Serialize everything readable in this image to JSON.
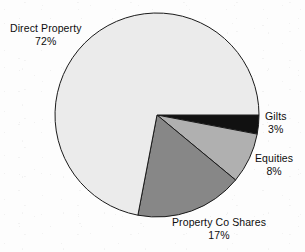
{
  "chart_data": {
    "type": "pie",
    "title": "",
    "subtitle": "",
    "xlabel": "",
    "ylabel": "",
    "legend_position": "none",
    "grid": false,
    "unit": "%",
    "start_angle_deg": 0,
    "direction": "clockwise",
    "categories": [
      "Gilts",
      "Equities",
      "Property Co Shares",
      "Direct Property"
    ],
    "values": [
      3,
      8,
      17,
      72
    ],
    "slices": [
      {
        "label": "Gilts",
        "value": 3,
        "value_text": "3%",
        "color": "#111111",
        "start_deg": 0,
        "end_deg": 10.8,
        "label_position": "right"
      },
      {
        "label": "Equities",
        "value": 8,
        "value_text": "8%",
        "color": "#b0b0b0",
        "start_deg": 10.8,
        "end_deg": 39.6,
        "label_position": "right"
      },
      {
        "label": "Property Co Shares",
        "value": 17,
        "value_text": "17%",
        "color": "#878787",
        "start_deg": 39.6,
        "end_deg": 100.8,
        "label_position": "bottom"
      },
      {
        "label": "Direct Property",
        "value": 72,
        "value_text": "72%",
        "color": "#ebebeb",
        "start_deg": 100.8,
        "end_deg": 360,
        "label_position": "top-left"
      }
    ],
    "stroke_color": "#1a1a1a",
    "background": "#ffffff",
    "center_x": 157,
    "center_y": 115,
    "radius": 102
  },
  "labels": {
    "direct_property": {
      "name": "Direct Property",
      "value": "72%"
    },
    "gilts": {
      "name": "Gilts",
      "value": "3%"
    },
    "equities": {
      "name": "Equities",
      "value": "8%"
    },
    "property_co_shares": {
      "name": "Property Co Shares",
      "value": "17%"
    }
  }
}
